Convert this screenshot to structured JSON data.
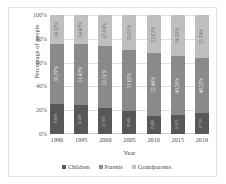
{
  "chart_data": {
    "type": "bar",
    "stacked": true,
    "normalized_percent": true,
    "title": "",
    "xlabel": "Year",
    "ylabel": "Percentage of people",
    "categories": [
      "1990",
      "1995",
      "2000",
      "2005",
      "2010",
      "2015",
      "2019"
    ],
    "ylim": [
      0,
      100
    ],
    "yticks": [
      "0%",
      "20%",
      "40%",
      "60%",
      "80%",
      "100%"
    ],
    "ytick_values": [
      0,
      20,
      40,
      60,
      80,
      100
    ],
    "grid": true,
    "grid_axis": "y",
    "legend_position": "bottom",
    "series": [
      {
        "name": "Children",
        "color": "#585858",
        "values": [
          25.06,
          24.14,
          21.55,
          19.34,
          15.49,
          16.31,
          17.73
        ],
        "labels": [
          "25.06%",
          "24.14%",
          "21.55%",
          "19.34%",
          "15.49%",
          "16.31%",
          "17.73%"
        ]
      },
      {
        "name": "Parents",
        "color": "#8a8a8a",
        "values": [
          50.77,
          51.43,
          52.51,
          51.63,
          52.48,
          49.3,
          46.53
        ],
        "labels": [
          "50.77%",
          "51.43%",
          "52.51%",
          "51.63%",
          "52.48%",
          "49.30%",
          "46.53%"
        ]
      },
      {
        "name": "Grandparents",
        "color": "#bfbfbf",
        "values": [
          24.17,
          24.43,
          25.94,
          29.03,
          32.03,
          34.39,
          35.74
        ],
        "labels": [
          "24.17%",
          "24.43%",
          "25.94%",
          "29.03%",
          "32.03%",
          "34.39%",
          "35.74%"
        ]
      }
    ]
  },
  "legend": {
    "items": [
      {
        "label": "Children",
        "color": "#585858"
      },
      {
        "label": "Parents",
        "color": "#8a8a8a"
      },
      {
        "label": "Grandparents",
        "color": "#bfbfbf"
      }
    ]
  }
}
